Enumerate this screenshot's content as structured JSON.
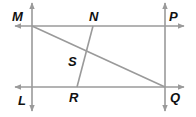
{
  "diagram": {
    "type": "geometry-figure",
    "colors": {
      "line": "#9a9a9a",
      "label": "#111111",
      "background": "#ffffff"
    },
    "points": {
      "M": {
        "label": "M",
        "x": 32,
        "y": 26
      },
      "N": {
        "label": "N",
        "x": 93,
        "y": 26
      },
      "P": {
        "label": "P",
        "x": 165,
        "y": 26
      },
      "L": {
        "label": "L",
        "x": 32,
        "y": 87
      },
      "R": {
        "label": "R",
        "x": 77,
        "y": 87
      },
      "Q": {
        "label": "Q",
        "x": 165,
        "y": 87
      },
      "S": {
        "label": "S",
        "x": 85,
        "y": 50
      }
    },
    "lines": [
      {
        "name": "line-MP",
        "type": "line",
        "from": "M",
        "to": "P"
      },
      {
        "name": "line-LQ",
        "type": "line",
        "from": "L",
        "to": "Q"
      },
      {
        "name": "line-ML",
        "type": "line",
        "from": "M",
        "to": "L"
      },
      {
        "name": "line-PQ",
        "type": "line",
        "from": "P",
        "to": "Q"
      },
      {
        "name": "segment-MQ",
        "type": "segment",
        "from": "M",
        "to": "Q"
      },
      {
        "name": "segment-NR",
        "type": "segment",
        "from": "N",
        "to": "R"
      }
    ],
    "labels": {
      "M": "M",
      "N": "N",
      "P": "P",
      "S": "S",
      "L": "L",
      "R": "R",
      "Q": "Q"
    }
  }
}
